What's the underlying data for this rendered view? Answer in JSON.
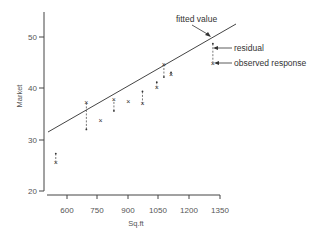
{
  "chart_data": {
    "type": "scatter",
    "title": "",
    "xlabel": "Sq.ft",
    "ylabel": "Market",
    "xlim": [
      500,
      1350
    ],
    "ylim": [
      20,
      55
    ],
    "x_ticks": [
      600,
      750,
      900,
      1050,
      1200,
      1350
    ],
    "y_ticks": [
      20,
      30,
      40,
      50
    ],
    "grid": false,
    "legend": null,
    "points": [
      {
        "x": 545,
        "y": 25.5,
        "fitted": 27.3
      },
      {
        "x": 695,
        "y": 37.3,
        "fitted": 32.0
      },
      {
        "x": 765,
        "y": 33.8,
        "fitted": 33.8
      },
      {
        "x": 830,
        "y": 37.8,
        "fitted": 35.6
      },
      {
        "x": 900,
        "y": 37.5,
        "fitted": 37.5
      },
      {
        "x": 970,
        "y": 37.0,
        "fitted": 39.4
      },
      {
        "x": 1040,
        "y": 40.2,
        "fitted": 41.2
      },
      {
        "x": 1075,
        "y": 44.6,
        "fitted": 42.2
      },
      {
        "x": 1110,
        "y": 42.6,
        "fitted": 43.1
      },
      {
        "x": 1315,
        "y": 44.8,
        "fitted": 48.7
      }
    ],
    "fitted_line": {
      "x0": 505,
      "y0": 26.0,
      "x1": 1430,
      "y1": 51.8
    },
    "annotations": [
      {
        "text": "fitted value",
        "target": "fitted point at x=1315"
      },
      {
        "text": "residual",
        "target": "dashed segment at x=1315"
      },
      {
        "text": "observed response",
        "target": "observed point at x=1315"
      }
    ]
  },
  "labels": {
    "xlabel": "Sq.ft",
    "ylabel": "Market",
    "x_ticks": [
      "600",
      "750",
      "900",
      "1050",
      "1200",
      "1350"
    ],
    "y_ticks": [
      "50",
      "40",
      "30",
      "20"
    ],
    "annot_fitted": "fitted value",
    "annot_residual": "residual",
    "annot_observed": "observed response"
  }
}
